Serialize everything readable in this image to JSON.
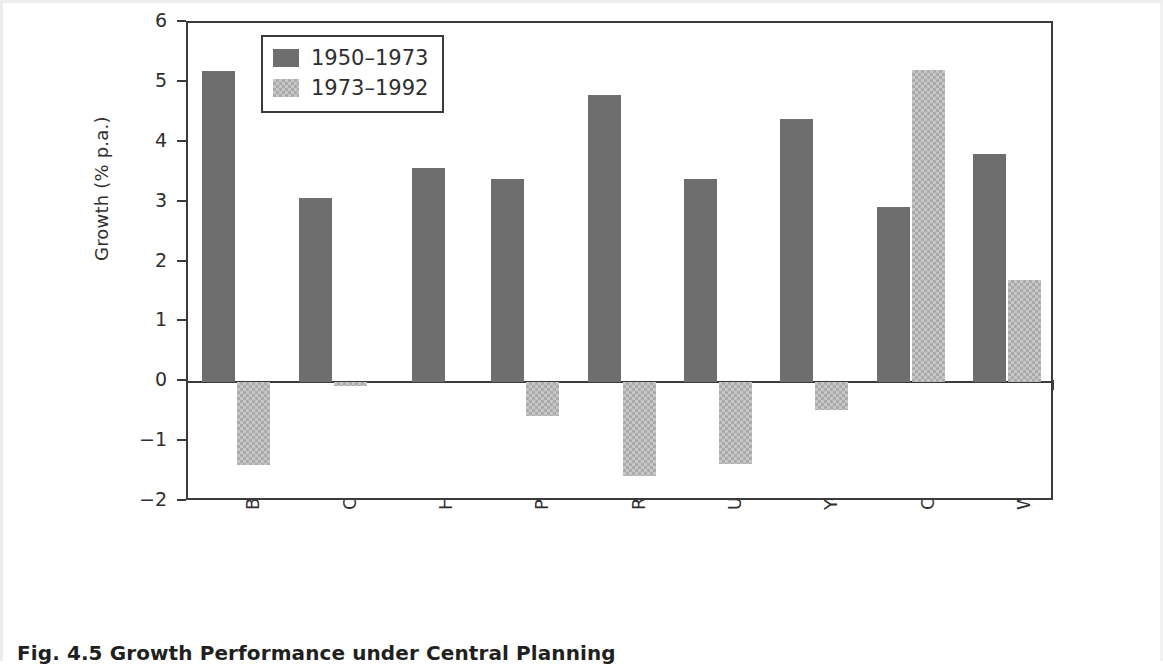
{
  "figure": {
    "caption": "Fig. 4.5  Growth Performance under Central Planning",
    "background_color": "#ffffff",
    "frame_color": "#3b3b3b"
  },
  "legend": {
    "position": "upper-left-inside",
    "entries": [
      {
        "label": "1950–1973",
        "color": "#6e6e6e",
        "pattern": "solid"
      },
      {
        "label": "1973–1992",
        "color": "#c6c6c6",
        "pattern": "checkered"
      }
    ]
  },
  "chart_data": {
    "type": "bar",
    "title": "",
    "subtitle": "",
    "xlabel": "",
    "ylabel": "Growth (% p.a.)",
    "ylim": [
      -2,
      6
    ],
    "yticks": [
      -2,
      -1,
      0,
      1,
      2,
      3,
      4,
      5,
      6
    ],
    "ytick_labels": [
      "−2",
      "−1",
      "0",
      "1",
      "2",
      "3",
      "4",
      "5",
      "6"
    ],
    "grid": false,
    "legend_position": "upper left",
    "categories": [
      "Bulgaria",
      "Czechoslovakia",
      "Hungary",
      "Poland",
      "Romania",
      "USSR",
      "Yougoslavia",
      "China",
      "Western Europe"
    ],
    "series": [
      {
        "name": "1950–1973",
        "color": "#6e6e6e",
        "values": [
          5.2,
          3.08,
          3.58,
          3.4,
          4.8,
          3.4,
          4.4,
          2.93,
          3.82
        ]
      },
      {
        "name": "1973–1992",
        "color": "#c6c6c6",
        "values": [
          -1.38,
          -0.06,
          null,
          -0.57,
          -1.56,
          -1.36,
          -0.47,
          5.22,
          1.71
        ]
      }
    ]
  }
}
